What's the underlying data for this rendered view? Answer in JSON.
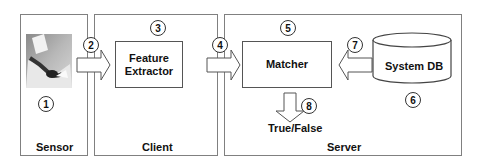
{
  "diagram": {
    "panels": {
      "sensor": {
        "label": "Sensor"
      },
      "client": {
        "label": "Client"
      },
      "server": {
        "label": "Server"
      }
    },
    "components": {
      "feature_extractor": {
        "line1": "Feature",
        "line2": "Extractor"
      },
      "matcher": {
        "label": "Matcher"
      },
      "system_db": {
        "label": "System DB"
      }
    },
    "output": {
      "label": "True/False"
    },
    "step_numbers": {
      "sensor": "1",
      "sensor_to_client": "2",
      "feature_extractor": "3",
      "client_to_server": "4",
      "matcher": "5",
      "system_db": "6",
      "db_to_matcher": "7",
      "matcher_output": "8"
    },
    "icons": {
      "sensor_image": "fingerprint-scanner-photo"
    },
    "colors": {
      "border": "#808080",
      "arrow_fill": "#ffffff",
      "arrow_stroke": "#555555",
      "text": "#111111"
    }
  }
}
